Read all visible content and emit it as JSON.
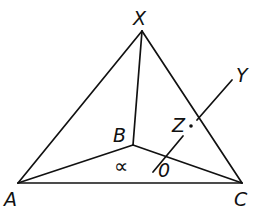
{
  "figure": {
    "type": "geometry-diagram",
    "points": [
      {
        "id": "X",
        "label": "X"
      },
      {
        "id": "A",
        "label": "A"
      },
      {
        "id": "B",
        "label": "B"
      },
      {
        "id": "C",
        "label": "C"
      },
      {
        "id": "O",
        "label": "0"
      },
      {
        "id": "Z",
        "label": "Z"
      },
      {
        "id": "Y",
        "label": "Y"
      }
    ],
    "segments": [
      "XA",
      "XC",
      "AC",
      "XB",
      "AB",
      "BC",
      "OY"
    ],
    "angle_symbol": "∝",
    "colors": {
      "ink": "#111111",
      "background": "#ffffff"
    }
  }
}
